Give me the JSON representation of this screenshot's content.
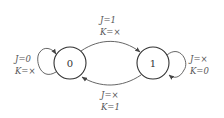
{
  "diagram": {
    "type": "state-transition",
    "states": [
      {
        "id": "s0",
        "label": "0"
      },
      {
        "id": "s1",
        "label": "1"
      }
    ],
    "transitions": [
      {
        "from": "0",
        "to": "0",
        "j": "J=0",
        "k": "K=×"
      },
      {
        "from": "0",
        "to": "1",
        "j": "J=1",
        "k": "K=×"
      },
      {
        "from": "1",
        "to": "0",
        "j": "J=×",
        "k": "K=1"
      },
      {
        "from": "1",
        "to": "1",
        "j": "J=×",
        "k": "K=0"
      }
    ]
  }
}
